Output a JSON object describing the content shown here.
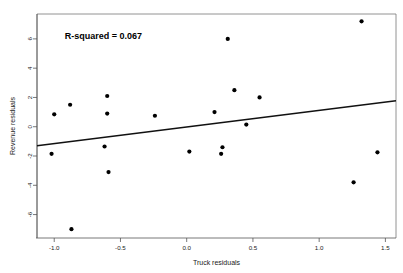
{
  "chart_data": {
    "type": "scatter",
    "title": "",
    "xlabel": "Truck residuals",
    "ylabel": "Revenue residuals",
    "xlim": [
      -1.13,
      1.58
    ],
    "ylim": [
      -7.6,
      7.7
    ],
    "xticks": [
      -1.0,
      -0.5,
      0.0,
      0.5,
      1.0,
      1.5
    ],
    "xticklabels": [
      "-1.0",
      "-0.5",
      "0.0",
      "0.5",
      "1.0",
      "1.5"
    ],
    "yticks": [
      6,
      4,
      2,
      0,
      -2,
      -4,
      -6
    ],
    "yticklabels": [
      "6",
      "4",
      "2",
      "0",
      "-2",
      "-4",
      "-6"
    ],
    "grid": false,
    "legend": null,
    "annotations": [
      {
        "text": "R-squared = 0.067",
        "x": -0.92,
        "y": 6.0
      }
    ],
    "series": [
      {
        "name": "residual points",
        "marker": "filled-circle",
        "color": "#000000",
        "points": [
          {
            "x": -1.02,
            "y": -1.85
          },
          {
            "x": -1.0,
            "y": 0.85
          },
          {
            "x": -0.88,
            "y": 1.5
          },
          {
            "x": -0.87,
            "y": -7.0
          },
          {
            "x": -0.62,
            "y": -1.35
          },
          {
            "x": -0.6,
            "y": 2.1
          },
          {
            "x": -0.6,
            "y": 0.9
          },
          {
            "x": -0.59,
            "y": -3.1
          },
          {
            "x": -0.24,
            "y": 0.75
          },
          {
            "x": 0.02,
            "y": -1.7
          },
          {
            "x": 0.21,
            "y": 1.0
          },
          {
            "x": 0.26,
            "y": -1.85
          },
          {
            "x": 0.27,
            "y": -1.4
          },
          {
            "x": 0.31,
            "y": 6.0
          },
          {
            "x": 0.36,
            "y": 2.5
          },
          {
            "x": 0.45,
            "y": 0.15
          },
          {
            "x": 0.55,
            "y": 2.0
          },
          {
            "x": 1.26,
            "y": -3.8
          },
          {
            "x": 1.32,
            "y": 7.2
          },
          {
            "x": 1.44,
            "y": -1.75
          }
        ]
      }
    ],
    "fit_line": {
      "name": "least-squares regression line",
      "color": "#111111",
      "x_start": -1.13,
      "y_start": -1.3,
      "x_end": 1.58,
      "y_end": 1.78
    }
  }
}
